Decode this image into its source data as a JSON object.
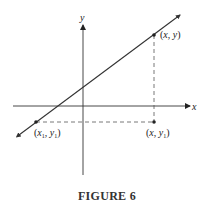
{
  "figure": {
    "caption": "FIGURE 6",
    "axes": {
      "x_label": "x",
      "y_label": "y"
    },
    "points": [
      {
        "id": "p_xy",
        "label_main": "(x, y)",
        "x": 154,
        "y": 35
      },
      {
        "id": "p_x1y1",
        "label_main": "(x1, y1)",
        "x": 36,
        "y": 122
      },
      {
        "id": "p_xy1",
        "label_main": "(x, y1)",
        "x": 154,
        "y": 122
      }
    ],
    "colors": {
      "line": "#333333",
      "axis": "#333333",
      "dashed": "#555555"
    }
  }
}
